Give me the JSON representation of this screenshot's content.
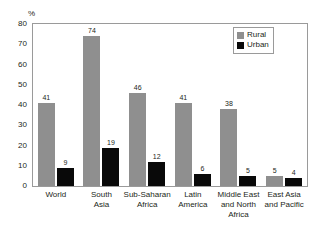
{
  "chart_data": {
    "type": "bar",
    "title": "",
    "xlabel": "",
    "ylabel": "%",
    "ylim": [
      0,
      80
    ],
    "ytick_labels": [
      "80",
      "70",
      "60",
      "50",
      "40",
      "30",
      "20",
      "10",
      "0"
    ],
    "ytick_values": [
      80,
      70,
      60,
      50,
      40,
      30,
      20,
      10,
      0
    ],
    "grid": false,
    "legend_position": "top-right",
    "categories": [
      "World",
      "South Asia",
      "Sub-Saharan Africa",
      "Latin America",
      "Middle East and North Africa",
      "East Asia and Pacific"
    ],
    "category_lines": [
      [
        "World"
      ],
      [
        "South",
        "Asia"
      ],
      [
        "Sub-Saharan",
        "Africa"
      ],
      [
        "Latin",
        "America"
      ],
      [
        "Middle East",
        "and North",
        "Africa"
      ],
      [
        "East Asia",
        "and Pacific"
      ]
    ],
    "series": [
      {
        "name": "Rural",
        "color": "#8f8f8f",
        "values": [
          41,
          74,
          46,
          41,
          38,
          5
        ]
      },
      {
        "name": "Urban",
        "color": "#090909",
        "values": [
          9,
          19,
          12,
          6,
          5,
          4
        ]
      }
    ]
  },
  "legend": {
    "items": [
      {
        "label": "Rural",
        "color": "#8f8f8f"
      },
      {
        "label": "Urban",
        "color": "#090909"
      }
    ]
  },
  "colors": {
    "rural": "#8f8f8f",
    "urban": "#090909",
    "frame": "#9a9a9a",
    "text": "#231f20",
    "background": "#ffffff"
  }
}
